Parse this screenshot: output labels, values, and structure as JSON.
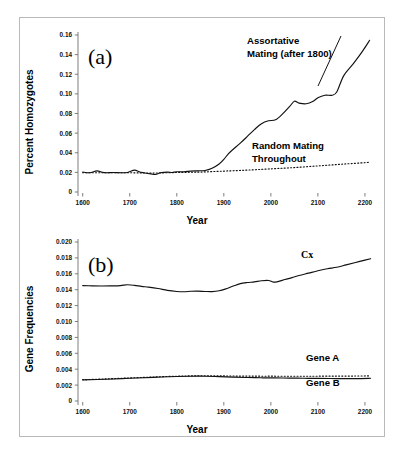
{
  "figure": {
    "background_color": "#ffffff",
    "border_color": "#b9b9b9",
    "line_color": "#111111"
  },
  "chart_data": [
    {
      "type": "line",
      "panel": "(a)",
      "title": "",
      "xlabel": "Year",
      "ylabel": "Percent Homozygotes",
      "xlim": [
        1590,
        2215
      ],
      "ylim": [
        0,
        0.16
      ],
      "xticks": [
        1600,
        1700,
        1800,
        1900,
        2000,
        2100,
        2200
      ],
      "xticklabels": [
        "1600",
        "1700",
        "1800",
        "1900",
        "2000",
        "2100",
        "2200"
      ],
      "yticks": [
        0,
        0.02,
        0.04,
        0.06,
        0.08,
        0.1,
        0.12,
        0.14,
        0.16
      ],
      "yticklabels": [
        "0",
        "0.02",
        "0.04",
        "0.06",
        "0.08",
        "0.10",
        "0.12",
        "0.14",
        "0.16"
      ],
      "grid": false,
      "legend_position": "inline-annotation",
      "series": [
        {
          "name": "Assortative Mating (after 1800)",
          "style": "solid",
          "x": [
            1600,
            1615,
            1630,
            1640,
            1650,
            1665,
            1680,
            1695,
            1710,
            1720,
            1730,
            1745,
            1755,
            1765,
            1780,
            1790,
            1800,
            1815,
            1830,
            1845,
            1860,
            1875,
            1890,
            1900,
            1910,
            1920,
            1935,
            1950,
            1965,
            1980,
            1995,
            2010,
            2025,
            2040,
            2050,
            2060,
            2075,
            2090,
            2100,
            2115,
            2130,
            2140,
            2155,
            2175,
            2195,
            2210
          ],
          "y": [
            0.0203,
            0.0196,
            0.0215,
            0.0203,
            0.0196,
            0.0199,
            0.0196,
            0.0199,
            0.0223,
            0.0206,
            0.0196,
            0.0184,
            0.0179,
            0.0196,
            0.0203,
            0.0199,
            0.0206,
            0.0206,
            0.0213,
            0.0216,
            0.0219,
            0.0242,
            0.0286,
            0.0332,
            0.0392,
            0.0436,
            0.0498,
            0.0566,
            0.0636,
            0.0696,
            0.0726,
            0.0736,
            0.0796,
            0.0872,
            0.0925,
            0.0906,
            0.0899,
            0.0925,
            0.0961,
            0.0986,
            0.0986,
            0.1019,
            0.1186,
            0.1306,
            0.1436,
            0.1546
          ]
        },
        {
          "name": "Random Mating Throughout",
          "style": "dotted",
          "x": [
            1600,
            1650,
            1700,
            1750,
            1800,
            1850,
            1900,
            1950,
            2000,
            2050,
            2100,
            2150,
            2200,
            2210
          ],
          "y": [
            0.0196,
            0.0196,
            0.0196,
            0.0193,
            0.0199,
            0.0203,
            0.0213,
            0.0223,
            0.0236,
            0.0249,
            0.0266,
            0.0283,
            0.0299,
            0.0303
          ]
        }
      ],
      "annotations": [
        {
          "text_line1": "Assortative",
          "text_line2": "Mating (after 1800)",
          "x": 2030,
          "y": 0.136
        },
        {
          "text_line1": "Random Mating",
          "text_line2": "Throughout",
          "x": 2030,
          "y": 0.047
        }
      ]
    },
    {
      "type": "line",
      "panel": "(b)",
      "title": "",
      "xlabel": "Year",
      "ylabel": "Gene Frequencies",
      "xlim": [
        1590,
        2215
      ],
      "ylim": [
        0,
        0.02
      ],
      "xticks": [
        1600,
        1700,
        1800,
        1900,
        2000,
        2100,
        2200
      ],
      "xticklabels": [
        "1600",
        "1700",
        "1800",
        "1900",
        "2000",
        "2100",
        "2200"
      ],
      "yticks": [
        0,
        0.002,
        0.004,
        0.006,
        0.008,
        0.01,
        0.012,
        0.014,
        0.016,
        0.018,
        0.02
      ],
      "yticklabels": [
        "0",
        "0.002",
        "0.004",
        "0.006",
        "0.008",
        "0.010",
        "0.012",
        "0.014",
        "0.016",
        "0.018",
        "0.020"
      ],
      "grid": false,
      "legend_position": "inline-annotation",
      "series": [
        {
          "name": "Cx",
          "style": "solid",
          "x": [
            1600,
            1620,
            1640,
            1660,
            1680,
            1695,
            1710,
            1725,
            1740,
            1760,
            1780,
            1800,
            1815,
            1830,
            1845,
            1860,
            1875,
            1890,
            1905,
            1920,
            1935,
            1950,
            1965,
            1980,
            1995,
            2005,
            2015,
            2030,
            2045,
            2060,
            2080,
            2100,
            2120,
            2140,
            2160,
            2180,
            2200,
            2212
          ],
          "y": [
            0.01452,
            0.01448,
            0.01446,
            0.01448,
            0.01452,
            0.01462,
            0.01455,
            0.01442,
            0.01432,
            0.01415,
            0.01392,
            0.01378,
            0.01374,
            0.0138,
            0.01382,
            0.01378,
            0.01376,
            0.01386,
            0.01412,
            0.01446,
            0.01476,
            0.0149,
            0.01498,
            0.01512,
            0.01516,
            0.01496,
            0.01502,
            0.01528,
            0.01552,
            0.01578,
            0.01608,
            0.01638,
            0.01664,
            0.01682,
            0.01712,
            0.01742,
            0.01772,
            0.0179
          ]
        },
        {
          "name": "Gene A",
          "style": "dotted",
          "x": [
            1600,
            1650,
            1700,
            1750,
            1800,
            1830,
            1860,
            1890,
            1920,
            1950,
            1980,
            2010,
            2040,
            2070,
            2100,
            2140,
            2180,
            2212
          ],
          "y": [
            0.00268,
            0.00278,
            0.0029,
            0.00302,
            0.00312,
            0.00316,
            0.00318,
            0.00316,
            0.00314,
            0.00313,
            0.00312,
            0.00312,
            0.00311,
            0.00311,
            0.00312,
            0.00313,
            0.00314,
            0.00316
          ]
        },
        {
          "name": "Gene B",
          "style": "solid",
          "x": [
            1600,
            1650,
            1700,
            1750,
            1800,
            1830,
            1860,
            1890,
            1920,
            1950,
            1980,
            2010,
            2040,
            2070,
            2100,
            2140,
            2180,
            2212
          ],
          "y": [
            0.00266,
            0.00274,
            0.00286,
            0.00298,
            0.00308,
            0.00312,
            0.00312,
            0.00306,
            0.003,
            0.00296,
            0.00292,
            0.0029,
            0.00288,
            0.00286,
            0.00284,
            0.00282,
            0.00282,
            0.00286
          ]
        }
      ],
      "annotations": [
        {
          "text_line1": "Cx",
          "x": 2090,
          "y": 0.0186
        },
        {
          "text_line1": "Gene A",
          "x": 2110,
          "y": 0.0042
        },
        {
          "text_line1": "Gene B",
          "x": 2110,
          "y": 0.0017
        }
      ]
    }
  ]
}
